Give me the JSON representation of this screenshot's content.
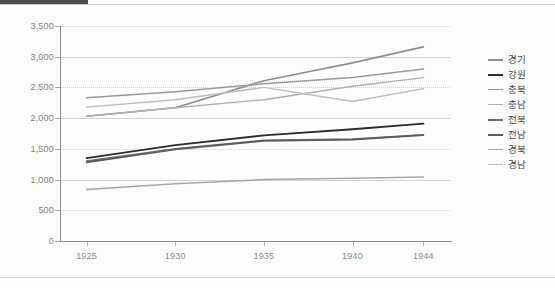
{
  "chart_data": {
    "type": "line",
    "title": "",
    "subtitle": "",
    "xlabel": "",
    "ylabel": "",
    "x": [
      1925,
      1930,
      1935,
      1940,
      1944
    ],
    "categories": [
      "1925",
      "1930",
      "1935",
      "1940",
      "1944"
    ],
    "xtick_labels": [
      "1925",
      "1930",
      "1935",
      "1940",
      "1944"
    ],
    "ytick_labels": [
      "0",
      "500",
      "1,000",
      "1,500",
      "2,000",
      "2,500",
      "3,000",
      "3,500"
    ],
    "ytick_values": [
      0,
      500,
      1000,
      1500,
      2000,
      2500,
      3000,
      3500
    ],
    "ylim": [
      0,
      3500
    ],
    "xlim": [
      1923.5,
      1945.5
    ],
    "grid": true,
    "legend_position": "right",
    "series": [
      {
        "name": "경기",
        "values": [
          2030,
          2170,
          2610,
          2900,
          3160
        ],
        "color": "#8f8f8f",
        "width": 1.6
      },
      {
        "name": "강원",
        "values": [
          1350,
          1560,
          1720,
          1820,
          1910
        ],
        "color": "#2d2d2d",
        "width": 1.9
      },
      {
        "name": "충북",
        "values": [
          2330,
          2430,
          2560,
          2660,
          2800
        ],
        "color": "#9a9a9a",
        "width": 1.5
      },
      {
        "name": "충남",
        "values": [
          2030,
          2170,
          2300,
          2520,
          2660
        ],
        "color": "#b0b0b0",
        "width": 1.4
      },
      {
        "name": "전북",
        "values": [
          1300,
          1500,
          1640,
          1660,
          1730
        ],
        "color": "#707070",
        "width": 1.7
      },
      {
        "name": "전남",
        "values": [
          1280,
          1490,
          1630,
          1650,
          1725
        ],
        "color": "#5c5c5c",
        "width": 1.7
      },
      {
        "name": "경북",
        "values": [
          840,
          930,
          1000,
          1020,
          1040
        ],
        "color": "#a5a5a5",
        "width": 1.5
      },
      {
        "name": "경남",
        "values": [
          2180,
          2300,
          2500,
          2270,
          2480
        ],
        "color": "#bdbdbd",
        "width": 1.4
      }
    ]
  },
  "theme": {
    "background": "#fdfdfd",
    "gridline_color": "#d3d3d3",
    "axis_color": "#8c8c8c",
    "tick_text_color": "#808080",
    "legend_text_color": "#454545",
    "top_bar_color": "#4a4a4a"
  }
}
